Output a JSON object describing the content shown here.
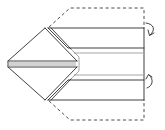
{
  "diagram": {
    "type": "origami-fold-instruction",
    "colors": {
      "line": "#2b2b2b",
      "background": "#ffffff"
    },
    "elements": [
      {
        "name": "diamond-point",
        "style": "solid"
      },
      {
        "name": "top-strip",
        "style": "solid"
      },
      {
        "name": "bottom-strip",
        "style": "solid"
      },
      {
        "name": "middle-strip",
        "style": "thin"
      },
      {
        "name": "dashed-outline",
        "style": "dashed"
      },
      {
        "name": "fold-arrow-top",
        "direction": "fold-behind-down"
      },
      {
        "name": "fold-arrow-bottom",
        "direction": "fold-behind-up"
      }
    ]
  }
}
